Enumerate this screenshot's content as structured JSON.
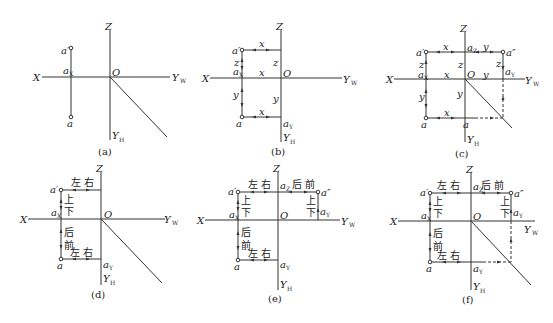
{
  "panels": [
    {
      "id": "a",
      "caption": "(a)",
      "labels": {
        "X": "X",
        "Z": "Z",
        "O": "O",
        "YW": "Y",
        "YW_sub": "W",
        "YH": "Y",
        "YH_sub": "H",
        "a_prime": "a′",
        "aX": "a",
        "aX_sub": "X",
        "a": "a"
      }
    },
    {
      "id": "b",
      "caption": "(b)",
      "labels": {
        "X": "X",
        "Z": "Z",
        "O": "O",
        "YW": "Y",
        "YW_sub": "W",
        "YH": "Y",
        "YH_sub": "H",
        "a_prime": "a′",
        "aX": "a",
        "aX_sub": "X",
        "a": "a",
        "aY": "a",
        "aY_sub": "Y",
        "x_top": "x",
        "x_mid": "x",
        "x_bot": "x",
        "z_left": "z",
        "z_right": "z",
        "y_left": "y",
        "y_right": "y"
      }
    },
    {
      "id": "c",
      "caption": "(c)",
      "labels": {
        "X": "X",
        "Z": "Z",
        "O": "O",
        "YW": "Y",
        "YW_sub": "W",
        "YH": "Y",
        "YH_sub": "H",
        "a_prime": "a′",
        "a_dprime": "a″",
        "aX": "a",
        "aX_sub": "X",
        "aZ": "a",
        "aZ_sub": "Z",
        "aYW": "a",
        "aYW_sub": "Y",
        "aYH": "a",
        "a": "a",
        "x_top": "x",
        "x_mid": "x",
        "x_bot": "x",
        "y_top": "y",
        "y_mid": "y",
        "z_left": "z",
        "z_mid": "z",
        "z_right": "z",
        "y_left": "y",
        "y_center": "y"
      }
    },
    {
      "id": "d",
      "caption": "(d)",
      "labels": {
        "X": "X",
        "Z": "Z",
        "O": "O",
        "YW": "Y",
        "YW_sub": "W",
        "YH": "Y",
        "YH_sub": "H",
        "a_prime": "a′",
        "aX": "a",
        "aX_sub": "X",
        "a": "a",
        "aY": "a",
        "aY_sub": "Y",
        "left_right_top": "左 右",
        "up": "上",
        "down": "下",
        "back": "后",
        "front": "前",
        "left_right_bot": "左 右"
      }
    },
    {
      "id": "e",
      "caption": "(e)",
      "labels": {
        "X": "X",
        "Z": "Z",
        "O": "O",
        "YW": "Y",
        "YW_sub": "W",
        "YH": "Y",
        "YH_sub": "H",
        "a_prime": "a′",
        "a_dprime": "a″",
        "aX": "a",
        "aX_sub": "X",
        "aZ": "a",
        "aZ_sub": "Z",
        "aYW": "a",
        "aYW_sub": "Y",
        "aY": "a",
        "aY_sub": "Y",
        "a": "a",
        "left_right_top": "左 右",
        "back_front_top": "后 前",
        "up": "上",
        "down": "下",
        "up_r": "上",
        "down_r": "下",
        "back": "后",
        "front": "前",
        "left_right_bot": "左 右"
      }
    },
    {
      "id": "f",
      "caption": "(f)",
      "labels": {
        "X": "X",
        "Z": "Z",
        "O": "O",
        "YW": "Y",
        "YW_sub": "W",
        "YH": "Y",
        "YH_sub": "H",
        "a_prime": "a′",
        "a_dprime": "a″",
        "aX": "a",
        "aX_sub": "X",
        "aZ": "a",
        "aZ_sub": "Z",
        "aYW": "a",
        "aYW_sub": "Y",
        "aY": "a",
        "aY_sub": "Y",
        "a": "a",
        "left_right_top": "左 右",
        "back_front_top": "后 前",
        "up": "上",
        "down": "下",
        "up_r": "上",
        "down_r": "下",
        "back": "后",
        "front": "前",
        "left_right_bot": "左 右"
      }
    }
  ]
}
